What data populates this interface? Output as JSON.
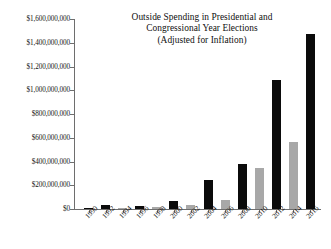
{
  "chart_data": {
    "type": "bar",
    "title": "Outside Spending in Presidential and Congressional Year Elections (Adjusted for Inflation)",
    "title_lines": [
      "Outside Spending in Presidential and",
      "Congressional Year Elections",
      "(Adjusted for Inflation)"
    ],
    "xlabel": "",
    "ylabel": "",
    "ylim": [
      0,
      1600000000
    ],
    "grid": false,
    "legend": "none",
    "categories": [
      "1990",
      "1992",
      "1994",
      "1996",
      "1998",
      "2000",
      "2002",
      "2004",
      "2006",
      "2008",
      "2010",
      "2012",
      "2014",
      "2016"
    ],
    "values": [
      6000000,
      30000000,
      7000000,
      25000000,
      17000000,
      70000000,
      35000000,
      245000000,
      80000000,
      378000000,
      342000000,
      1085000000,
      565000000,
      1470000000
    ],
    "bar_colors": [
      "#0b0b0b",
      "#0b0b0b",
      "#a8a8a8",
      "#0b0b0b",
      "#a8a8a8",
      "#0b0b0b",
      "#a8a8a8",
      "#0b0b0b",
      "#a8a8a8",
      "#0b0b0b",
      "#a8a8a8",
      "#0b0b0b",
      "#a8a8a8",
      "#0b0b0b"
    ],
    "series": [
      {
        "name": "Outside Spending",
        "values": [
          6000000,
          30000000,
          7000000,
          25000000,
          17000000,
          70000000,
          35000000,
          245000000,
          80000000,
          378000000,
          342000000,
          1085000000,
          565000000,
          1470000000
        ]
      }
    ],
    "ytick_labels": [
      "$0",
      "$200,000,000",
      "$400,000,000",
      "$600,000,000",
      "$800,000,000",
      "$1,000,000,000",
      "$1,200,000,000",
      "$1,400,000,000",
      "$1,600,000,000"
    ],
    "ytick_values": [
      0,
      200000000,
      400000000,
      600000000,
      800000000,
      1000000000,
      1200000000,
      1400000000,
      1600000000
    ],
    "colors": {
      "presidential_year_bar": "#0b0b0b",
      "congressional_year_bar": "#a8a8a8",
      "axis": "#6e6e6e",
      "text": "#141414",
      "background": "#ffffff"
    }
  }
}
